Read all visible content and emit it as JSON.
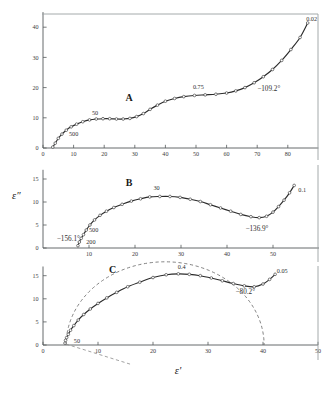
{
  "figure": {
    "title": "",
    "axis_titles": {
      "x": "ε'",
      "y": "ε″"
    },
    "background": "#ffffff",
    "curve_color": "#2b2b2b",
    "dash_color": "#6d6d6d"
  },
  "chart_data": [
    {
      "type": "scatter",
      "panel": "A",
      "title": "A",
      "xlabel": "ε'",
      "ylabel": "ε″",
      "xlim": [
        0,
        90
      ],
      "ylim": [
        0,
        45
      ],
      "xticks": [
        0,
        10,
        20,
        30,
        40,
        50,
        60,
        70,
        80
      ],
      "xticklabels": [
        "0",
        "10",
        "20",
        "30",
        "40",
        "50",
        "60",
        "70",
        "80"
      ],
      "yticks": [
        0,
        10,
        20,
        30,
        40
      ],
      "yticklabels": [
        "0",
        "10",
        "20",
        "30",
        "40"
      ],
      "grid": false,
      "legend": null,
      "annotations": [
        {
          "text": "A",
          "x": 27,
          "y": 15.5,
          "kind": "panel-id"
        },
        {
          "text": "500",
          "x": 8.5,
          "y": 4.0,
          "kind": "frequency"
        },
        {
          "text": "50",
          "x": 16.0,
          "y": 11.0,
          "kind": "frequency"
        },
        {
          "text": "0.75",
          "x": 49.0,
          "y": 19.5,
          "kind": "frequency"
        },
        {
          "text": "0.02",
          "x": 86.0,
          "y": 42.0,
          "kind": "frequency"
        },
        {
          "text": "−109.2°",
          "x": 70.0,
          "y": 19.0,
          "kind": "angle"
        }
      ],
      "points": [
        {
          "x": 3.2,
          "y": 0.3
        },
        {
          "x": 4.0,
          "y": 1.6
        },
        {
          "x": 5.0,
          "y": 3.2
        },
        {
          "x": 6.2,
          "y": 4.6
        },
        {
          "x": 7.6,
          "y": 5.9
        },
        {
          "x": 9.2,
          "y": 7.0
        },
        {
          "x": 11.0,
          "y": 7.9
        },
        {
          "x": 13.0,
          "y": 8.7
        },
        {
          "x": 15.2,
          "y": 9.3
        },
        {
          "x": 17.4,
          "y": 9.6
        },
        {
          "x": 19.6,
          "y": 9.7
        },
        {
          "x": 21.8,
          "y": 9.7
        },
        {
          "x": 24.0,
          "y": 9.6
        },
        {
          "x": 26.2,
          "y": 9.6
        },
        {
          "x": 28.4,
          "y": 9.8
        },
        {
          "x": 30.6,
          "y": 10.4
        },
        {
          "x": 32.8,
          "y": 11.4
        },
        {
          "x": 35.0,
          "y": 12.8
        },
        {
          "x": 37.4,
          "y": 14.2
        },
        {
          "x": 40.0,
          "y": 15.5
        },
        {
          "x": 43.0,
          "y": 16.4
        },
        {
          "x": 46.0,
          "y": 17.0
        },
        {
          "x": 49.5,
          "y": 17.4
        },
        {
          "x": 53.0,
          "y": 17.6
        },
        {
          "x": 56.5,
          "y": 17.8
        },
        {
          "x": 60.0,
          "y": 18.2
        },
        {
          "x": 63.0,
          "y": 18.9
        },
        {
          "x": 66.0,
          "y": 20.0
        },
        {
          "x": 69.0,
          "y": 21.6
        },
        {
          "x": 72.0,
          "y": 23.6
        },
        {
          "x": 75.0,
          "y": 26.0
        },
        {
          "x": 78.0,
          "y": 29.0
        },
        {
          "x": 81.0,
          "y": 32.6
        },
        {
          "x": 84.0,
          "y": 36.6
        },
        {
          "x": 86.5,
          "y": 41.4
        }
      ]
    },
    {
      "type": "scatter",
      "panel": "B",
      "title": "B",
      "xlabel": "ε'",
      "ylabel": "ε″",
      "xlim": [
        0,
        60
      ],
      "ylim": [
        0,
        17
      ],
      "xticks": [
        10,
        20,
        30,
        40,
        50
      ],
      "xticklabels": [
        "10",
        "20",
        "30",
        "40",
        "50"
      ],
      "yticks": [
        0,
        5,
        10,
        15
      ],
      "yticklabels": [
        "0",
        "5",
        "10",
        "15"
      ],
      "grid": false,
      "legend": null,
      "annotations": [
        {
          "text": "B",
          "x": 18.0,
          "y": 13.5,
          "kind": "panel-id"
        },
        {
          "text": "−156.1°",
          "x": 3.0,
          "y": 1.6,
          "kind": "angle"
        },
        {
          "text": "200",
          "x": 9.4,
          "y": 0.9,
          "kind": "frequency"
        },
        {
          "text": "500",
          "x": 10.0,
          "y": 3.4,
          "kind": "frequency"
        },
        {
          "text": "30",
          "x": 24.0,
          "y": 12.6,
          "kind": "frequency"
        },
        {
          "text": "−136.9°",
          "x": 44.0,
          "y": 3.6,
          "kind": "angle"
        },
        {
          "text": "0.1",
          "x": 55.5,
          "y": 12.1,
          "kind": "frequency"
        }
      ],
      "points": [
        {
          "x": 7.6,
          "y": 0.5
        },
        {
          "x": 7.9,
          "y": 1.3
        },
        {
          "x": 8.3,
          "y": 2.1
        },
        {
          "x": 8.8,
          "y": 2.9
        },
        {
          "x": 9.4,
          "y": 3.9
        },
        {
          "x": 10.2,
          "y": 5.0
        },
        {
          "x": 11.2,
          "y": 6.1
        },
        {
          "x": 12.4,
          "y": 7.1
        },
        {
          "x": 13.8,
          "y": 8.0
        },
        {
          "x": 15.4,
          "y": 8.8
        },
        {
          "x": 17.2,
          "y": 9.5
        },
        {
          "x": 19.2,
          "y": 10.2
        },
        {
          "x": 21.2,
          "y": 10.7
        },
        {
          "x": 23.2,
          "y": 11.1
        },
        {
          "x": 25.4,
          "y": 11.2
        },
        {
          "x": 27.6,
          "y": 11.2
        },
        {
          "x": 29.8,
          "y": 11.0
        },
        {
          "x": 32.0,
          "y": 10.6
        },
        {
          "x": 34.2,
          "y": 10.1
        },
        {
          "x": 36.4,
          "y": 9.4
        },
        {
          "x": 38.6,
          "y": 8.7
        },
        {
          "x": 40.8,
          "y": 8.0
        },
        {
          "x": 43.0,
          "y": 7.3
        },
        {
          "x": 45.2,
          "y": 6.8
        },
        {
          "x": 47.0,
          "y": 6.6
        },
        {
          "x": 48.6,
          "y": 6.9
        },
        {
          "x": 50.0,
          "y": 7.8
        },
        {
          "x": 51.2,
          "y": 9.0
        },
        {
          "x": 52.4,
          "y": 10.4
        },
        {
          "x": 53.6,
          "y": 12.0
        },
        {
          "x": 54.6,
          "y": 13.6
        }
      ]
    },
    {
      "type": "scatter",
      "panel": "C",
      "title": "C",
      "xlabel": "ε'",
      "ylabel": "ε″",
      "xlim": [
        0,
        50
      ],
      "ylim": [
        0,
        17
      ],
      "xticks": [
        0,
        10,
        20,
        30,
        40,
        50
      ],
      "xticklabels": [
        "0",
        "10",
        "20",
        "30",
        "40",
        "50"
      ],
      "yticks": [
        0,
        5,
        10,
        15
      ],
      "yticklabels": [
        "0",
        "5",
        "10",
        "15"
      ],
      "grid": false,
      "legend": null,
      "annotations": [
        {
          "text": "C",
          "x": 12.0,
          "y": 15.7,
          "kind": "panel-id"
        },
        {
          "text": "50",
          "x": 5.6,
          "y": 0.5,
          "kind": "frequency"
        },
        {
          "text": "0.4",
          "x": 24.5,
          "y": 16.4,
          "kind": "frequency"
        },
        {
          "text": "−80.2°",
          "x": 35.0,
          "y": 11.0,
          "kind": "angle"
        },
        {
          "text": "0.05",
          "x": 42.5,
          "y": 15.7,
          "kind": "frequency"
        }
      ],
      "points": [
        {
          "x": 4.0,
          "y": 0.4
        },
        {
          "x": 4.1,
          "y": 1.0
        },
        {
          "x": 4.3,
          "y": 1.6
        },
        {
          "x": 4.6,
          "y": 2.3
        },
        {
          "x": 5.0,
          "y": 3.2
        },
        {
          "x": 5.6,
          "y": 4.2
        },
        {
          "x": 6.4,
          "y": 5.4
        },
        {
          "x": 7.4,
          "y": 6.6
        },
        {
          "x": 8.6,
          "y": 7.8
        },
        {
          "x": 10.0,
          "y": 9.0
        },
        {
          "x": 11.6,
          "y": 10.2
        },
        {
          "x": 13.4,
          "y": 11.4
        },
        {
          "x": 15.4,
          "y": 12.6
        },
        {
          "x": 17.6,
          "y": 13.6
        },
        {
          "x": 20.0,
          "y": 14.6
        },
        {
          "x": 22.4,
          "y": 15.2
        },
        {
          "x": 24.6,
          "y": 15.4
        },
        {
          "x": 26.6,
          "y": 15.3
        },
        {
          "x": 28.6,
          "y": 15.0
        },
        {
          "x": 30.6,
          "y": 14.5
        },
        {
          "x": 32.6,
          "y": 13.9
        },
        {
          "x": 34.6,
          "y": 13.3
        },
        {
          "x": 36.6,
          "y": 12.8
        },
        {
          "x": 38.4,
          "y": 12.6
        },
        {
          "x": 40.0,
          "y": 13.2
        },
        {
          "x": 41.2,
          "y": 14.2
        },
        {
          "x": 42.2,
          "y": 15.3
        }
      ],
      "dashed_arc": {
        "description": "Cole-Cole semicircular arc fit",
        "center_x": 22.2,
        "radius": 18.0,
        "x_start": 4.2,
        "x_end": 40.2
      },
      "dashed_chord": {
        "description": "low-frequency electrode polarization line",
        "x1": 4.2,
        "y1": 0.2,
        "x2": 16.0,
        "y2": -4.2
      }
    }
  ]
}
